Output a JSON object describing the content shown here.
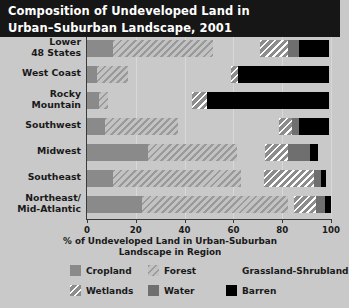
{
  "title": {
    "line1": "Composition of Undeveloped Land in",
    "line2": "Urban–Suburban Landscape, 2001"
  },
  "axis": {
    "x_title_line1": "% of Undeveloped Land in Urban-Suburban",
    "x_title_line2": "Landscape in Region",
    "x_ticks": [
      "0",
      "20",
      "40",
      "60",
      "80",
      "100"
    ]
  },
  "legend": {
    "items": [
      {
        "label": "Cropland",
        "key": "cropland",
        "color": "#8a8a8a"
      },
      {
        "label": "Forest",
        "key": "forest",
        "color": "#9a9a9a"
      },
      {
        "label": "Grassland-Shrubland",
        "key": "grassland",
        "color": "#2b2b2b"
      },
      {
        "label": "Wetlands",
        "key": "wetlands",
        "color": "#8d8d8d"
      },
      {
        "label": "Water",
        "key": "water",
        "color": "#6f6f6f"
      },
      {
        "label": "Barren",
        "key": "barren",
        "color": "#000000"
      }
    ]
  },
  "chart_data": {
    "type": "bar",
    "orientation": "horizontal",
    "stacked": true,
    "title": "Composition of Undeveloped Land in Urban–Suburban Landscape, 2001",
    "xlabel": "% of Undeveloped Land in Urban-Suburban Landscape in Region",
    "ylabel": "",
    "xlim": [
      0,
      100
    ],
    "xticks": [
      0,
      20,
      40,
      60,
      80,
      100
    ],
    "grid": true,
    "legend_position": "bottom",
    "categories": [
      "Lower 48 States",
      "West Coast",
      "Rocky Mountain",
      "Southwest",
      "Midwest",
      "Southeast",
      "Northeast/Mid-Atlantic"
    ],
    "category_labels": [
      [
        "Lower",
        "48 States"
      ],
      [
        "West Coast"
      ],
      [
        "Rocky",
        "Mountain"
      ],
      [
        "Southwest"
      ],
      [
        "Midwest"
      ],
      [
        "Southeast"
      ],
      [
        "Northeast/",
        "Mid-Atlantic"
      ]
    ],
    "series": [
      {
        "name": "Cropland",
        "key": "cropland",
        "values": [
          10.5,
          4.0,
          5.0,
          7.5,
          25.0,
          10.5,
          22.5
        ]
      },
      {
        "name": "Forest",
        "key": "forest",
        "values": [
          41.0,
          13.0,
          3.5,
          30.0,
          36.5,
          52.5,
          60.0
        ]
      },
      {
        "name": "Grassland-Shrubland",
        "key": "grassland",
        "values": [
          19.5,
          42.0,
          34.5,
          41.0,
          11.5,
          9.5,
          2.5
        ]
      },
      {
        "name": "Wetlands",
        "key": "wetlands",
        "values": [
          11.5,
          3.0,
          6.0,
          5.5,
          9.5,
          20.5,
          9.0
        ]
      },
      {
        "name": "Water",
        "key": "water",
        "values": [
          4.5,
          0.0,
          0.0,
          3.0,
          9.0,
          3.0,
          3.5
        ]
      },
      {
        "name": "Barren",
        "key": "barren",
        "values": [
          12.0,
          37.0,
          50.0,
          12.0,
          3.0,
          2.0,
          2.5
        ]
      }
    ]
  }
}
